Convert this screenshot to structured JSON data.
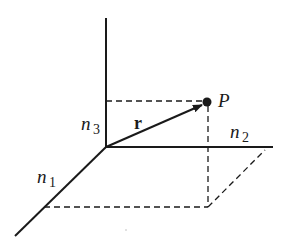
{
  "diagram": {
    "colors": {
      "ink": "#1a1a1a",
      "background": "#ffffff"
    },
    "axes": {
      "n1": {
        "label": "n",
        "subscript": "1"
      },
      "n2": {
        "label": "n",
        "subscript": "2"
      },
      "n3": {
        "label": "n",
        "subscript": "3"
      }
    },
    "vector": {
      "label": "r"
    },
    "point": {
      "label": "P"
    }
  }
}
